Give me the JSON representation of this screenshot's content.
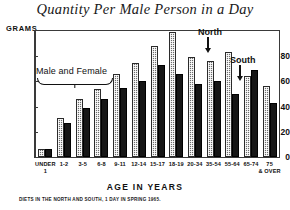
{
  "chart_data": {
    "type": "bar",
    "title": "Quantity Per Male Person in a Day",
    "xlabel": "AGE IN YEARS",
    "ylabel": "GRAMS",
    "ylim": [
      0,
      100
    ],
    "yticks": [
      0,
      20,
      40,
      60,
      80
    ],
    "grid": false,
    "legend_position": "in-plot-annotations",
    "categories": [
      "UNDER 1",
      "1-2",
      "3-5",
      "6-8",
      "9-11",
      "12-14",
      "15-17",
      "18-19",
      "20-34",
      "35-54",
      "55-64",
      "65-74",
      "75 & OVER"
    ],
    "category_lines": [
      [
        "UNDER",
        "1"
      ],
      [
        "1-2",
        ""
      ],
      [
        "3-5",
        ""
      ],
      [
        "6-8",
        ""
      ],
      [
        "9-11",
        ""
      ],
      [
        "12-14",
        ""
      ],
      [
        "15-17",
        ""
      ],
      [
        "18-19",
        ""
      ],
      [
        "20-34",
        ""
      ],
      [
        "35-54",
        ""
      ],
      [
        "55-64",
        ""
      ],
      [
        "65-74",
        ""
      ],
      [
        "75",
        "& OVER"
      ]
    ],
    "series": [
      {
        "name": "North",
        "color": "#6d6d6d",
        "pattern": "cross-hatch",
        "values": [
          6,
          31,
          46,
          54,
          66,
          75,
          88,
          99,
          79,
          76,
          83,
          64,
          56
        ]
      },
      {
        "name": "South",
        "color": "#161616",
        "pattern": "solid",
        "values": [
          6,
          27,
          39,
          46,
          55,
          60,
          73,
          66,
          58,
          60,
          50,
          69,
          43
        ]
      }
    ],
    "annotations": [
      {
        "text": "Male and Female",
        "kind": "bracket-label"
      },
      {
        "text": "North",
        "kind": "arrow-label"
      },
      {
        "text": "South",
        "kind": "arrow-label"
      }
    ],
    "footnote": "DIETS IN THE NORTH AND SOUTH, 1 DAY IN SPRING 1965."
  }
}
